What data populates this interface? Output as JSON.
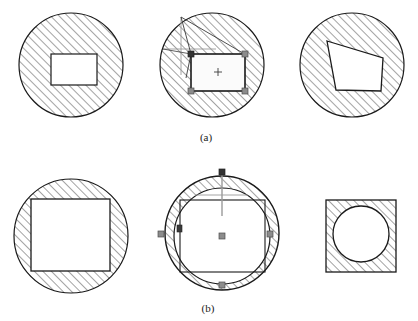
{
  "figure": {
    "width": 418,
    "height": 321,
    "background_color": "#ffffff",
    "outline_color": "#1a1a1a",
    "hatch_color": "#555555",
    "handle_fill_color": "#8c8c8c",
    "handle_stroke_color": "#4d4d4d",
    "guide_color": "#9a9a9a",
    "fill_color": "#ffffff"
  },
  "captions": [
    {
      "label": "(a)",
      "x": 206,
      "y": 141
    },
    {
      "label": "(b)",
      "x": 208,
      "y": 312
    }
  ],
  "panels": [
    {
      "name": "row-a-panel-1-rectangle-in-circle",
      "row": "a",
      "index": 1,
      "description": "Hatched circle containing an unfilled axis-aligned rectangle",
      "circle": {
        "cx": 71,
        "cy": 65,
        "r": 52
      },
      "rect": {
        "x": 51,
        "y": 54,
        "w": 46,
        "h": 31
      }
    },
    {
      "name": "row-a-panel-2-selected-rectangle",
      "row": "a",
      "index": 2,
      "description": "Hatched circle with a selected rectangle showing corner handles, center cross and drag guide lines",
      "circle": {
        "cx": 212,
        "cy": 65,
        "r": 52
      },
      "rect": {
        "x": 191,
        "y": 54,
        "w": 54,
        "h": 37
      },
      "center_marker": {
        "x": 218,
        "y": 72,
        "type": "cross"
      },
      "handles": [
        {
          "x": 191,
          "y": 54,
          "kind": "corner-dark"
        },
        {
          "x": 245,
          "y": 54,
          "kind": "corner"
        },
        {
          "x": 191,
          "y": 91,
          "kind": "corner"
        },
        {
          "x": 245,
          "y": 91,
          "kind": "corner"
        }
      ],
      "guides": {
        "crosshair": {
          "x": 181,
          "y": 49
        },
        "vertical_line": {
          "x": 181,
          "y1": 17,
          "y2": 75
        },
        "horizontal_line": {
          "y": 49,
          "x1": 163,
          "x2": 216
        },
        "drag_lines": [
          {
            "x1": 181,
            "y1": 17,
            "x2": 191,
            "y2": 54
          },
          {
            "x1": 181,
            "y1": 17,
            "x2": 245,
            "y2": 54
          },
          {
            "x1": 163,
            "y1": 49,
            "x2": 191,
            "y2": 54
          },
          {
            "x1": 186,
            "y1": 75,
            "x2": 191,
            "y2": 54
          }
        ]
      }
    },
    {
      "name": "row-a-panel-3-skewed-quad-in-circle",
      "row": "a",
      "index": 3,
      "description": "Hatched circle containing an unfilled skewed quadrilateral",
      "circle": {
        "cx": 352,
        "cy": 65,
        "r": 52
      },
      "quad": [
        {
          "x": 327,
          "y": 41
        },
        {
          "x": 383,
          "y": 58
        },
        {
          "x": 381,
          "y": 91
        },
        {
          "x": 336,
          "y": 90
        }
      ]
    },
    {
      "name": "row-b-panel-1-large-rectangle-in-circle",
      "row": "b",
      "index": 1,
      "description": "Hatched circle containing a large unfilled rectangle",
      "circle": {
        "cx": 71,
        "cy": 236,
        "r": 57
      },
      "rect": {
        "x": 31,
        "y": 199,
        "w": 79,
        "h": 72
      }
    },
    {
      "name": "row-b-panel-2-selected-circle",
      "row": "b",
      "index": 2,
      "description": "Hatched outer circle with inner circle, selection rectangle, edge handles, center marker and guide lines",
      "circle": {
        "cx": 222,
        "cy": 233,
        "r": 57
      },
      "inner_circle": {
        "cx": 222,
        "cy": 236,
        "r": 48
      },
      "rect": {
        "x": 180,
        "y": 200,
        "w": 85,
        "h": 72
      },
      "center_marker": {
        "x": 222,
        "y": 236,
        "type": "square"
      },
      "handles": [
        {
          "x": 222,
          "y": 172,
          "kind": "edge-dark"
        },
        {
          "x": 161,
          "y": 234,
          "kind": "edge"
        },
        {
          "x": 270,
          "y": 234,
          "kind": "edge"
        },
        {
          "x": 222,
          "y": 285,
          "kind": "edge"
        },
        {
          "x": 180,
          "y": 228,
          "kind": "edge-dark"
        }
      ],
      "guides": {
        "vertical_line": {
          "x": 222,
          "y1": 172,
          "y2": 216
        },
        "horizontal_line": {
          "y": 195,
          "x1": 195,
          "x2": 248
        }
      }
    },
    {
      "name": "row-b-panel-3-circle-in-square",
      "row": "b",
      "index": 3,
      "description": "Hatched square containing an unfilled circle",
      "square": {
        "x": 326,
        "y": 200,
        "w": 70,
        "h": 72
      },
      "circle": {
        "cx": 361,
        "cy": 234,
        "r": 28
      }
    }
  ]
}
